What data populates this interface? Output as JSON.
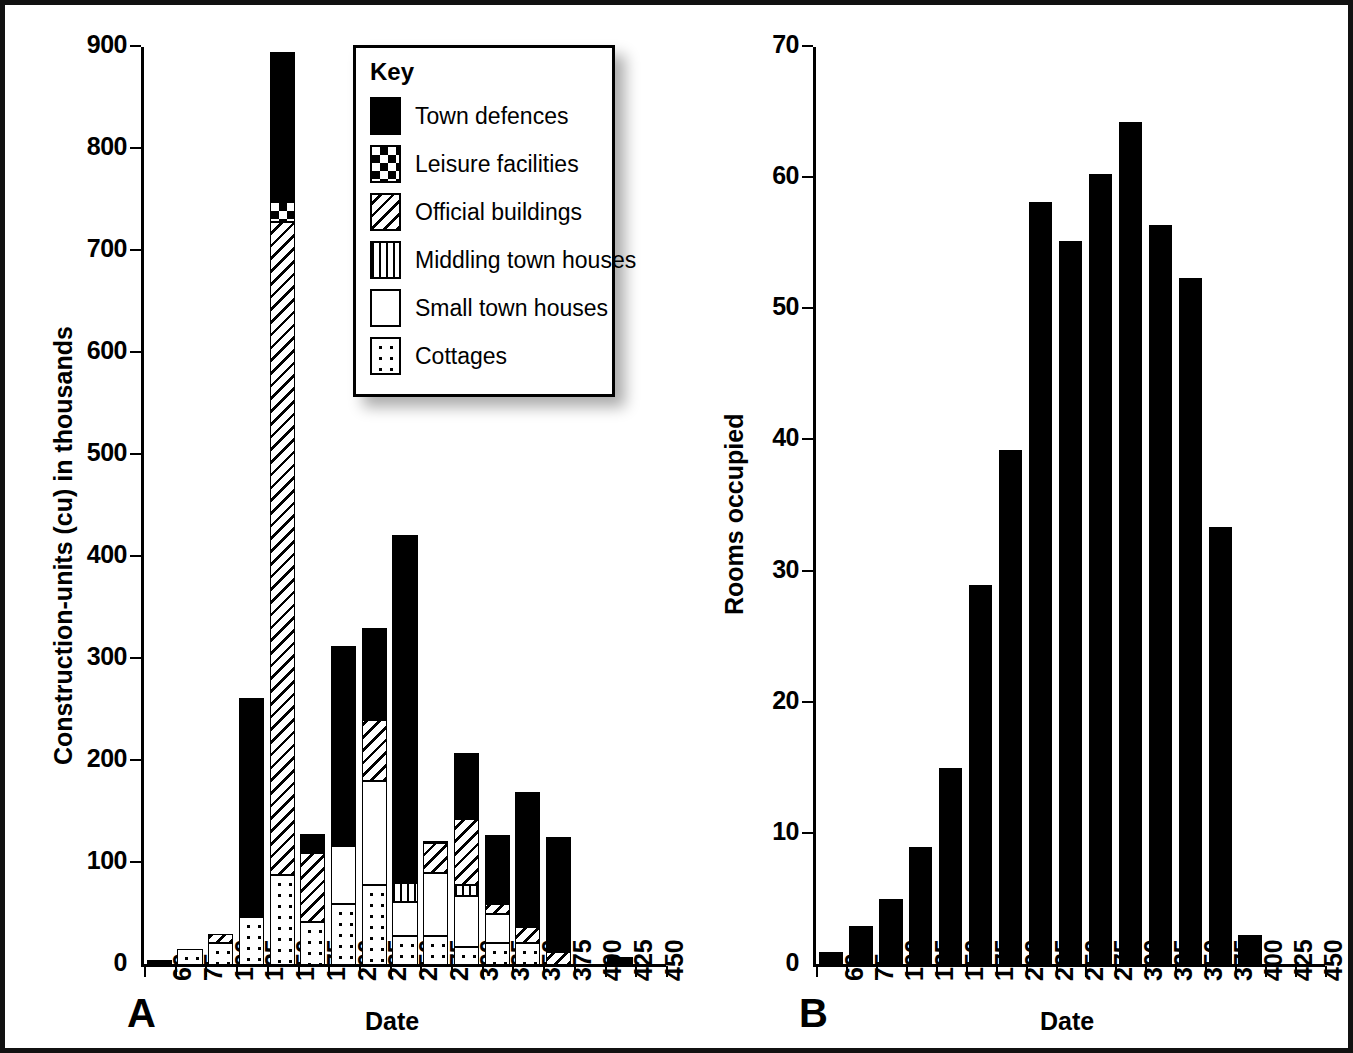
{
  "legend": {
    "title": "Key",
    "items": [
      {
        "label": "Town defences",
        "key": "defences"
      },
      {
        "label": "Leisure facilities",
        "key": "leisure"
      },
      {
        "label": "Official buildings",
        "key": "official"
      },
      {
        "label": "Middling town houses",
        "key": "middling"
      },
      {
        "label": "Small town houses",
        "key": "small"
      },
      {
        "label": "Cottages",
        "key": "cottages"
      }
    ]
  },
  "panels": [
    {
      "letter": "A"
    },
    {
      "letter": "B"
    }
  ],
  "colors": {
    "ink": "#000000",
    "paper": "#ffffff",
    "frame": "#111111"
  },
  "chart_data": [
    {
      "type": "bar",
      "id": "panel-a",
      "panel_letter": "A",
      "title": "",
      "xlabel": "Date",
      "ylabel": "Construction-units (cu) in thousands",
      "ylim": [
        0,
        900
      ],
      "yticks": [
        0,
        100,
        200,
        300,
        400,
        500,
        600,
        700,
        800,
        900
      ],
      "grid": false,
      "legend_position": "inside-top-center",
      "stacked": true,
      "categories": [
        "60",
        "75",
        "100",
        "125",
        "150",
        "175",
        "200",
        "225",
        "250",
        "275",
        "300",
        "325",
        "350",
        "375",
        "400",
        "425",
        "450"
      ],
      "series": [
        {
          "name": "Cottages",
          "key": "cottages",
          "values": [
            0,
            16,
            22,
            47,
            88,
            42,
            60,
            78,
            28,
            28,
            18,
            22,
            22,
            0,
            0,
            0,
            0
          ]
        },
        {
          "name": "Small town houses",
          "key": "small",
          "values": [
            0,
            0,
            0,
            0,
            0,
            0,
            57,
            102,
            34,
            62,
            50,
            28,
            0,
            0,
            0,
            0,
            0
          ]
        },
        {
          "name": "Middling town houses",
          "key": "middling",
          "values": [
            0,
            0,
            0,
            0,
            0,
            0,
            0,
            0,
            18,
            0,
            10,
            0,
            0,
            0,
            0,
            0,
            0
          ]
        },
        {
          "name": "Official buildings",
          "key": "official",
          "values": [
            0,
            0,
            8,
            0,
            640,
            68,
            0,
            60,
            0,
            30,
            65,
            10,
            15,
            13,
            0,
            0,
            0
          ]
        },
        {
          "name": "Leisure facilities",
          "key": "leisure",
          "values": [
            0,
            0,
            0,
            0,
            20,
            0,
            0,
            0,
            0,
            0,
            0,
            0,
            0,
            0,
            0,
            0,
            0
          ]
        },
        {
          "name": "Town defences",
          "key": "defences",
          "values": [
            5,
            0,
            0,
            215,
            147,
            18,
            196,
            90,
            342,
            2,
            65,
            67,
            133,
            113,
            0,
            8,
            0
          ]
        }
      ],
      "totals": [
        5,
        16,
        30,
        262,
        895,
        128,
        313,
        330,
        422,
        122,
        208,
        127,
        170,
        126,
        0,
        8,
        0
      ]
    },
    {
      "type": "bar",
      "id": "panel-b",
      "panel_letter": "B",
      "title": "",
      "xlabel": "Date",
      "ylabel": "Rooms occupied",
      "ylim": [
        0,
        70
      ],
      "yticks": [
        0,
        10,
        20,
        30,
        40,
        50,
        60,
        70
      ],
      "grid": false,
      "stacked": false,
      "categories": [
        "60",
        "75",
        "100",
        "125",
        "150",
        "175",
        "200",
        "225",
        "250",
        "275",
        "300",
        "325",
        "350",
        "375",
        "400",
        "425",
        "450"
      ],
      "values": [
        1,
        3,
        5,
        9,
        15,
        29,
        39.3,
        58.2,
        55.2,
        60.3,
        64.3,
        56.4,
        52.4,
        33.4,
        2.3,
        0,
        0
      ],
      "bar_color": "#000000"
    }
  ]
}
